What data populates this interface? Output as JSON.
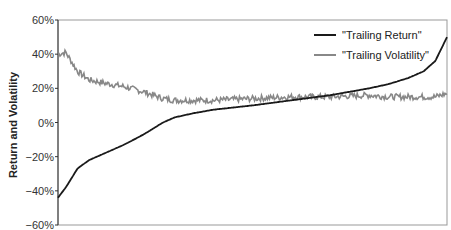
{
  "chart_data": {
    "type": "line",
    "title": "",
    "xlabel": "",
    "ylabel": "Return and Volatility",
    "ylim": [
      -0.6,
      0.6
    ],
    "yticks": [
      "60%",
      "40%",
      "20%",
      "0%",
      "-20%",
      "-40%",
      "-60%"
    ],
    "grid": false,
    "legend_position": "upper right",
    "x_normalized": [
      0,
      0.02,
      0.05,
      0.08,
      0.12,
      0.17,
      0.22,
      0.27,
      0.3,
      0.35,
      0.4,
      0.5,
      0.6,
      0.7,
      0.8,
      0.85,
      0.9,
      0.94,
      0.97,
      1.0
    ],
    "series": [
      {
        "name": "\"Trailing Return\"",
        "color": "#1a1a1a",
        "values": [
          -0.44,
          -0.38,
          -0.27,
          -0.22,
          -0.18,
          -0.13,
          -0.07,
          0.0,
          0.03,
          0.055,
          0.075,
          0.1,
          0.13,
          0.16,
          0.2,
          0.225,
          0.26,
          0.3,
          0.36,
          0.5
        ]
      },
      {
        "name": "\"Trailing Volatility\"",
        "color": "#888888",
        "values": [
          0.4,
          0.41,
          0.3,
          0.25,
          0.23,
          0.21,
          0.18,
          0.14,
          0.13,
          0.13,
          0.13,
          0.14,
          0.15,
          0.15,
          0.16,
          0.15,
          0.15,
          0.15,
          0.15,
          0.17
        ]
      }
    ]
  },
  "axis": {
    "ylabel": "Return and Volatility"
  },
  "legend": [
    {
      "label": "\"Trailing Return\"",
      "color": "#1a1a1a"
    },
    {
      "label": "\"Trailing Volatility\"",
      "color": "#888888"
    }
  ]
}
